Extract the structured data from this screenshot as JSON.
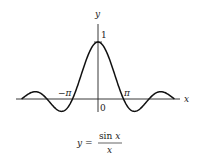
{
  "chart_data": {
    "type": "line",
    "title": "",
    "function": "sin(x)/x",
    "xlabel": "x",
    "ylabel": "y",
    "xlim": [
      -9.42,
      9.42
    ],
    "ylim": [
      -0.25,
      1.0
    ],
    "grid": false,
    "legend": "none",
    "x_tick_labels": [
      {
        "value": -3.14159,
        "label": "−π"
      },
      {
        "value": 3.14159,
        "label": "π"
      }
    ],
    "y_tick_labels": [
      {
        "value": 1,
        "label": "1"
      }
    ],
    "origin_label": "0",
    "caption": {
      "lhs": "y =",
      "numerator": "sin x",
      "denominator": "x"
    },
    "series": [
      {
        "name": "sin x / x",
        "color": "#111111"
      }
    ]
  }
}
